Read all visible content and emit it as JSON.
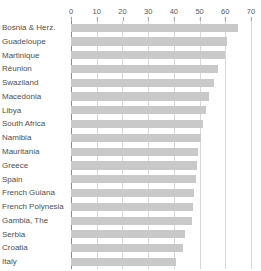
{
  "chart_data": {
    "type": "bar",
    "orientation": "horizontal",
    "title": "",
    "subtitle": "",
    "xlabel": "",
    "ylabel": "",
    "xlim": [
      0,
      70
    ],
    "xticks": [
      0,
      10,
      20,
      30,
      40,
      50,
      60,
      70
    ],
    "xtick_labels": [
      "0",
      "10",
      "20",
      "30",
      "40",
      "50",
      "60",
      "70"
    ],
    "grid": true,
    "grid_axis": "x",
    "legend": false,
    "legend_position": "none",
    "bar_color": "#c9c9c9",
    "axis_color": "#8c8c8c",
    "grid_color": "#d8d8d8",
    "label_color": "#4f4f4f",
    "categories": [
      "Bosnia & Herz.",
      "Guadeloupe",
      "Martinique",
      "Réunion",
      "Swaziland",
      "Macedonia",
      "Libya",
      "South Africa",
      "Namibia",
      "Mauritania",
      "Greece",
      "Spain",
      "French Guiana",
      "French Polynesia",
      "Gambia, The",
      "Serbia",
      "Croatia",
      "Italy"
    ],
    "values": [
      65,
      60.5,
      60,
      57,
      55.5,
      53.5,
      52.5,
      51.5,
      50.5,
      49.5,
      49,
      48.5,
      48,
      47.5,
      47,
      44.5,
      43.5,
      41
    ]
  }
}
